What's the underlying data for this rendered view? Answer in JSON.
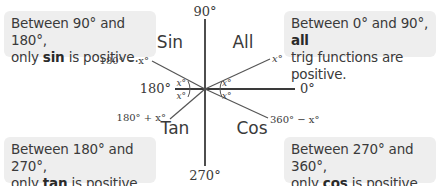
{
  "diagram": {
    "axes": {
      "top": "90°",
      "right": "0°",
      "bottom": "270°",
      "left": "180°"
    },
    "quadrants": {
      "top_left": "Sin",
      "top_right": "All",
      "bottom_left": "Tan",
      "bottom_right": "Cos"
    },
    "ray_labels": {
      "q1": "x°",
      "q2": "180° − x°",
      "q3": "180° + x°",
      "q4": "360° − x°"
    },
    "angle_label": "x°"
  },
  "notes": {
    "top_left": {
      "line1": "Between 90° and 180°,",
      "pre": "only ",
      "bold": "sin",
      "post": " is positive."
    },
    "top_right": {
      "line1_pre": "Between 0° and 90°, ",
      "line1_bold": "all",
      "line2": "trig functions are positive."
    },
    "bottom_left": {
      "line1": "Between 180° and 270°,",
      "pre": "only ",
      "bold": "tan",
      "post": " is positive."
    },
    "bottom_right": {
      "line1": "Between 270° and 360°,",
      "pre": "only ",
      "bold": "cos",
      "post": " is positive."
    }
  },
  "colors": {
    "line": "#3a3a3a",
    "box_bg": "#eeeeee",
    "text": "#3a3a3a"
  }
}
